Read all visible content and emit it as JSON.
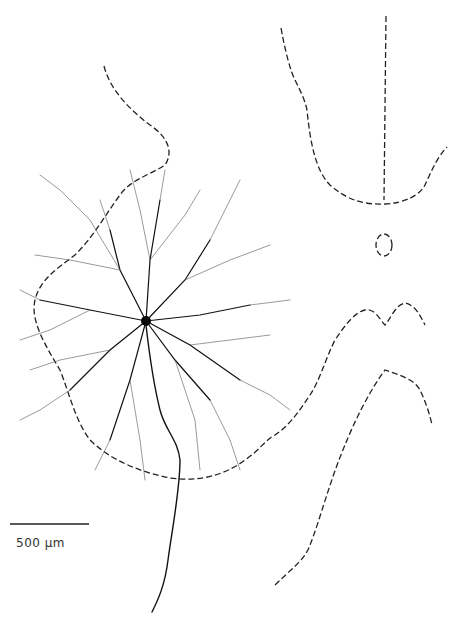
{
  "figure": {
    "scale_bar": {
      "label": "500 µm"
    }
  }
}
